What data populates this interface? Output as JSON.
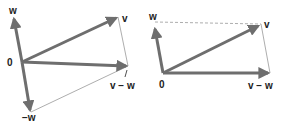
{
  "colors": {
    "vector": "#6e6e6e",
    "thin_line": "#8a8a8a",
    "label": "#222222"
  },
  "left_diagram": {
    "origin_label": "0",
    "w_label": "w",
    "v_label": "v",
    "v_minus_w_label": "v − w",
    "neg_w_label": "−w"
  },
  "right_diagram": {
    "origin_label": "0",
    "w_label": "w",
    "v_label": "v",
    "v_minus_w_label": "v − w"
  }
}
